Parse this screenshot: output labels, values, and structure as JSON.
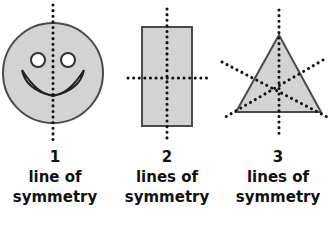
{
  "colors": {
    "fill": "#d3d3d3",
    "outline": "#4a4a4a",
    "dots": "#111111",
    "text": "#111111"
  },
  "shapes": [
    {
      "name": "smiley-face",
      "count": "1",
      "line1": "line of",
      "line2": "symmetry"
    },
    {
      "name": "rectangle",
      "count": "2",
      "line1": "lines of",
      "line2": "symmetry"
    },
    {
      "name": "equilateral-triangle",
      "count": "3",
      "line1": "lines of",
      "line2": "symmetry"
    }
  ]
}
